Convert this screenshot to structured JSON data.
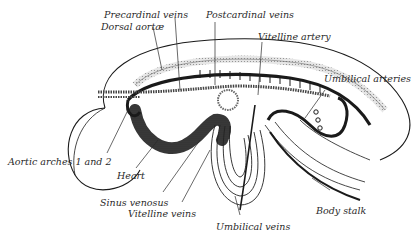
{
  "figure": {
    "labels": {
      "precardinal_veins": "Precardinal veins",
      "dorsal_aortae": "Dorsal aortæ",
      "postcardinal_veins": "Postcardinal veins",
      "vitelline_artery": "Vitelline artery",
      "umbilical_arteries": "Umbilical arteries",
      "aortic_arches": "Aortic arches 1 and 2",
      "heart": "Heart",
      "sinus_venosus": "Sinus venosus",
      "vitelline_veins": "Vitelline veins",
      "umbilical_veins": "Umbilical veins",
      "body_stalk": "Body stalk"
    },
    "colors": {
      "ink": "#1a1a1a",
      "shading": "#3a3a3a",
      "stipple": "#b5b5b5",
      "background": "#ffffff"
    }
  }
}
